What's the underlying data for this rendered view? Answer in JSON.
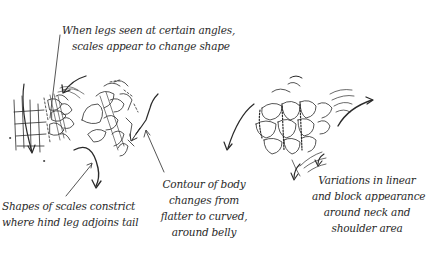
{
  "annotations": {
    "legs_angle": {
      "lines": [
        "When legs seen at certain angles,",
        "scales appear to change shape"
      ]
    },
    "hind_leg": {
      "lines": [
        "Shapes of scales constrict",
        "where hind leg adjoins tail"
      ]
    },
    "belly": {
      "lines": [
        "Contour of body",
        "changes from",
        "flatter to curved,",
        "around belly"
      ]
    },
    "neck": {
      "lines": [
        "Variations in linear",
        "and block appearance",
        "around neck and",
        "shoulder area"
      ]
    }
  },
  "colors": {
    "ink": "#2a2a2a",
    "background": "#ffffff"
  }
}
